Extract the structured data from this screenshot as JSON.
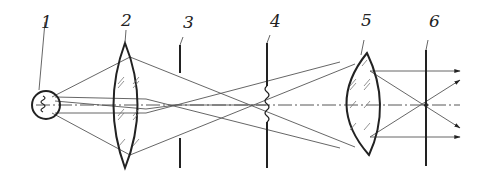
{
  "figure": {
    "type": "optical-schematic",
    "colors": {
      "line": "#222222",
      "ray": "#555555",
      "background": "#ffffff"
    }
  },
  "components": [
    {
      "id": "1",
      "label": "1",
      "name": "light-source",
      "x": 46
    },
    {
      "id": "2",
      "label": "2",
      "name": "condenser-lens",
      "x": 128
    },
    {
      "id": "3",
      "label": "3",
      "name": "aperture-diaphragm",
      "x": 180
    },
    {
      "id": "4",
      "label": "4",
      "name": "object-plane",
      "x": 266
    },
    {
      "id": "5",
      "label": "5",
      "name": "projection-lens",
      "x": 360
    },
    {
      "id": "6",
      "label": "6",
      "name": "image-plane",
      "x": 426
    }
  ]
}
